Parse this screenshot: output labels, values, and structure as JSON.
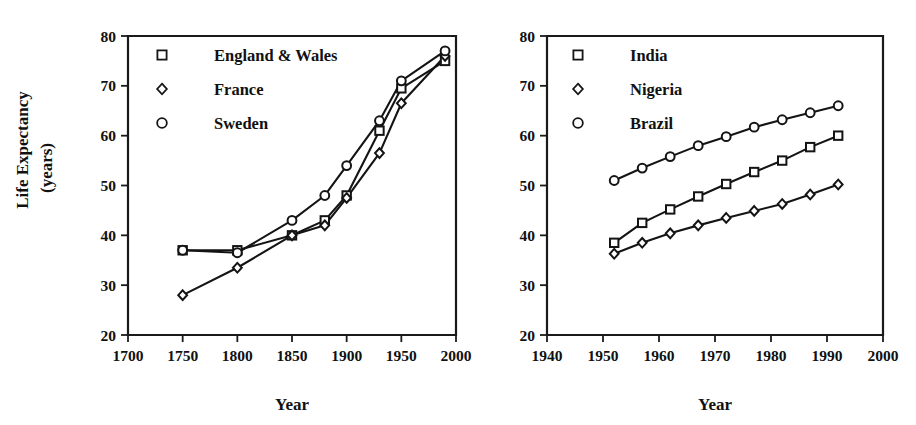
{
  "figure": {
    "background": "#ffffff",
    "ink_color": "#141414",
    "panel_count": 2
  },
  "chart_data": [
    {
      "type": "line",
      "panel": "left",
      "title": "",
      "xlabel": "Year",
      "ylabel": "Life Expectancy (years)",
      "ylabel_line1": "Life Expectancy",
      "ylabel_line2": "(years)",
      "xlim": [
        1700,
        2000
      ],
      "ylim": [
        20,
        80
      ],
      "xticks": [
        1700,
        1750,
        1800,
        1850,
        1900,
        1950,
        2000
      ],
      "xticklabels": [
        "1700",
        "1750",
        "1800",
        "1850",
        "1900",
        "1950",
        "2000"
      ],
      "yticks": [
        20,
        30,
        40,
        50,
        60,
        70,
        80
      ],
      "yticklabels": [
        "20",
        "30",
        "40",
        "50",
        "60",
        "70",
        "80"
      ],
      "grid": false,
      "legend_position": "top-left",
      "x": [
        1750,
        1800,
        1850,
        1880,
        1900,
        1930,
        1950,
        1990
      ],
      "series": [
        {
          "name": "England & Wales",
          "marker": "square",
          "x": [
            1750,
            1800,
            1850,
            1880,
            1900,
            1930,
            1950,
            1990
          ],
          "values": [
            37.0,
            37.0,
            40.0,
            43.0,
            48.0,
            61.0,
            69.5,
            75.0
          ]
        },
        {
          "name": "France",
          "marker": "diamond",
          "x": [
            1750,
            1800,
            1850,
            1880,
            1900,
            1930,
            1950,
            1990
          ],
          "values": [
            28.0,
            33.5,
            40.0,
            42.0,
            47.5,
            56.5,
            66.5,
            76.0
          ]
        },
        {
          "name": "Sweden",
          "marker": "circle",
          "x": [
            1750,
            1800,
            1850,
            1880,
            1900,
            1930,
            1950,
            1990
          ],
          "values": [
            37.0,
            36.5,
            43.0,
            48.0,
            54.0,
            63.0,
            71.0,
            77.0
          ]
        }
      ]
    },
    {
      "type": "line",
      "panel": "right",
      "title": "",
      "xlabel": "Year",
      "ylabel": "",
      "xlim": [
        1940,
        2000
      ],
      "ylim": [
        20,
        80
      ],
      "xticks": [
        1940,
        1950,
        1960,
        1970,
        1980,
        1990,
        2000
      ],
      "xticklabels": [
        "1940",
        "1950",
        "1960",
        "1970",
        "1980",
        "1990",
        "2000"
      ],
      "yticks": [
        20,
        30,
        40,
        50,
        60,
        70,
        80
      ],
      "yticklabels": [
        "20",
        "30",
        "40",
        "50",
        "60",
        "70",
        "80"
      ],
      "grid": false,
      "legend_position": "top-left",
      "x": [
        1952,
        1957,
        1962,
        1967,
        1972,
        1977,
        1982,
        1987,
        1992
      ],
      "series": [
        {
          "name": "India",
          "marker": "square",
          "x": [
            1952,
            1957,
            1962,
            1967,
            1972,
            1977,
            1982,
            1987,
            1992
          ],
          "values": [
            38.5,
            42.5,
            45.2,
            47.8,
            50.3,
            52.7,
            55.0,
            57.7,
            60.0
          ]
        },
        {
          "name": "Nigeria",
          "marker": "diamond",
          "x": [
            1952,
            1957,
            1962,
            1967,
            1972,
            1977,
            1982,
            1987,
            1992
          ],
          "values": [
            36.3,
            38.5,
            40.4,
            42.0,
            43.5,
            44.9,
            46.3,
            48.2,
            50.2
          ]
        },
        {
          "name": "Brazil",
          "marker": "circle",
          "x": [
            1952,
            1957,
            1962,
            1967,
            1972,
            1977,
            1982,
            1987,
            1992
          ],
          "values": [
            51.0,
            53.5,
            55.8,
            58.0,
            59.8,
            61.7,
            63.2,
            64.6,
            66.0
          ]
        }
      ]
    }
  ]
}
